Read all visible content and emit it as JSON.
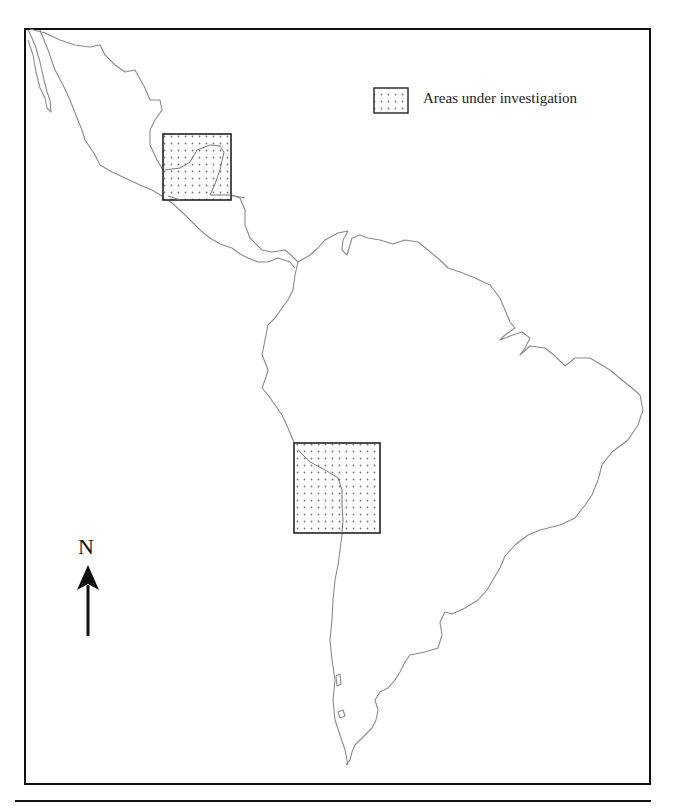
{
  "map": {
    "title": "Latin America study areas",
    "legend": {
      "label": "Areas under investigation",
      "symbol": "dotted-square"
    },
    "north_arrow": {
      "label": "N"
    },
    "study_areas": [
      {
        "name": "northern-area",
        "region": "Yucatan / Central America",
        "box": {
          "x": 163,
          "y": 134,
          "w": 68,
          "h": 66
        }
      },
      {
        "name": "southern-area",
        "region": "Central Andes",
        "box": {
          "x": 294,
          "y": 443,
          "w": 86,
          "h": 90
        }
      }
    ],
    "colors": {
      "outline": "#888888",
      "frame": "#111111",
      "dot": "#777777",
      "background": "#ffffff"
    }
  }
}
